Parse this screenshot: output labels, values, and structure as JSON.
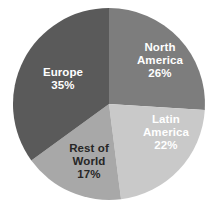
{
  "chart_data": {
    "type": "pie",
    "title": "",
    "subtitle": "",
    "xlabel": "",
    "ylabel": "",
    "legend_position": "none",
    "labels_inside_slices": true,
    "start_angle_deg": 0,
    "direction": "clockwise",
    "categories": [
      "North America",
      "Latin America",
      "Rest of World",
      "Europe"
    ],
    "values": [
      26,
      22,
      17,
      35
    ],
    "value_unit": "%",
    "slices": [
      {
        "name": "North America",
        "label_line1": "North",
        "label_line2": "America",
        "value": 26,
        "value_text": "26%",
        "color": "#7d7d7d",
        "text_color": "#ffffff"
      },
      {
        "name": "Latin America",
        "label_line1": "Latin",
        "label_line2": "America",
        "value": 22,
        "value_text": "22%",
        "color": "#c9c9c9",
        "text_color": "#ffffff"
      },
      {
        "name": "Rest of World",
        "label_line1": "Rest of",
        "label_line2": "World",
        "value": 17,
        "value_text": "17%",
        "color": "#a8a8a8",
        "text_color": "#262626"
      },
      {
        "name": "Europe",
        "label_line1": "Europe",
        "label_line2": "",
        "value": 35,
        "value_text": "35%",
        "color": "#5a5a5a",
        "text_color": "#ffffff"
      }
    ],
    "background_color": "#ffffff",
    "geometry": {
      "center_x": 109,
      "center_y": 104,
      "radius": 96
    }
  }
}
